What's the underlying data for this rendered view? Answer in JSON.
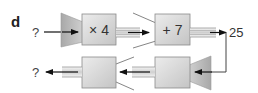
{
  "part_label": "d",
  "colors": {
    "box_fill_light": "#e2e2e2",
    "box_fill_dark": "#c2c2c2",
    "funnel_fill": "#b8b8b8",
    "stroke": "#8a8a8a",
    "arrow": "#111111",
    "text": "#333333"
  },
  "forward_chain": {
    "input": "?",
    "machines": [
      {
        "operation": "× 4"
      },
      {
        "operation": "+ 7"
      }
    ],
    "output": "25"
  },
  "inverse_chain": {
    "input": "25",
    "machines": [
      {
        "operation": ""
      },
      {
        "operation": ""
      }
    ],
    "output": "?"
  }
}
